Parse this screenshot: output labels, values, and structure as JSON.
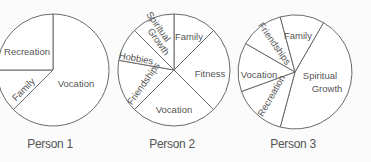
{
  "chart_data": [
    {
      "type": "pie",
      "title": "Person 1",
      "center": [
        53,
        70
      ],
      "radius": 56,
      "start_angle_deg_clockwise_from_top": 0,
      "slices": [
        {
          "label": "Vocation",
          "degrees": 225,
          "percent": 62.5
        },
        {
          "label": "Family",
          "degrees": 45,
          "percent": 12.5
        },
        {
          "label": "Recreation",
          "degrees": 90,
          "percent": 25
        }
      ],
      "labels": [
        {
          "text": "Vocation",
          "x": 76,
          "y": 84,
          "rotate": 0
        },
        {
          "text": "Family",
          "x": 24,
          "y": 90,
          "rotate": -45
        },
        {
          "text": "Recreation",
          "x": 27,
          "y": 52,
          "rotate": 0
        }
      ]
    },
    {
      "type": "pie",
      "title": "Person 2",
      "center": [
        174,
        70
      ],
      "radius": 56,
      "start_angle_deg_clockwise_from_top": 0,
      "slices": [
        {
          "label": "Family",
          "degrees": 45,
          "percent": 12.5
        },
        {
          "label": "Fitness",
          "degrees": 90,
          "percent": 25
        },
        {
          "label": "Vocation",
          "degrees": 90,
          "percent": 25
        },
        {
          "label": "Friendships",
          "degrees": 55,
          "percent": 15.3
        },
        {
          "label": "Hobbies",
          "degrees": 35,
          "percent": 9.7
        },
        {
          "label": "Spiritual Growth",
          "degrees": 45,
          "percent": 12.5
        }
      ],
      "labels": [
        {
          "text": "Family",
          "x": 189,
          "y": 37,
          "rotate": 0
        },
        {
          "text": "Fitness",
          "x": 210,
          "y": 74,
          "rotate": 0
        },
        {
          "text": "Vocation",
          "x": 174,
          "y": 110,
          "rotate": 0
        },
        {
          "text": "Friendships",
          "x": 144,
          "y": 84,
          "rotate": -55
        },
        {
          "text": "Hobbies",
          "x": 136,
          "y": 59,
          "rotate": 10
        },
        {
          "text": "Spiritual",
          "x": 158,
          "y": 27,
          "rotate": 55
        },
        {
          "text": "Growth",
          "x": 158,
          "y": 42,
          "rotate": 55
        }
      ]
    },
    {
      "type": "pie",
      "title": "Person 3",
      "center": [
        295,
        72
      ],
      "radius": 57,
      "start_angle_deg_clockwise_from_top": 30,
      "slices": [
        {
          "label": "Spiritual Growth",
          "degrees": 165,
          "percent": 45.8
        },
        {
          "label": "Recreation",
          "degrees": 55,
          "percent": 15.3
        },
        {
          "label": "Vocation",
          "degrees": 50,
          "percent": 13.9
        },
        {
          "label": "Friendships",
          "degrees": 45,
          "percent": 12.5
        },
        {
          "label": "Family",
          "degrees": 45,
          "percent": 12.5
        }
      ],
      "labels": [
        {
          "text": "Spiritual",
          "x": 320,
          "y": 76,
          "rotate": 0
        },
        {
          "text": "Growth",
          "x": 327,
          "y": 89,
          "rotate": 0
        },
        {
          "text": "Recreation",
          "x": 272,
          "y": 96,
          "rotate": -60
        },
        {
          "text": "Vocation",
          "x": 259,
          "y": 75,
          "rotate": 0
        },
        {
          "text": "Friendships",
          "x": 274,
          "y": 44,
          "rotate": 55
        },
        {
          "text": "Family",
          "x": 298,
          "y": 36,
          "rotate": 0
        }
      ]
    }
  ],
  "captions": [
    {
      "text": "Person 1",
      "x": 50
    },
    {
      "text": "Person 2",
      "x": 172
    },
    {
      "text": "Person 3",
      "x": 293
    }
  ],
  "colors": {
    "stroke": "#6a6a6a",
    "fill": "#ffffff",
    "text": "#555555",
    "background": "#fbfbfb"
  }
}
